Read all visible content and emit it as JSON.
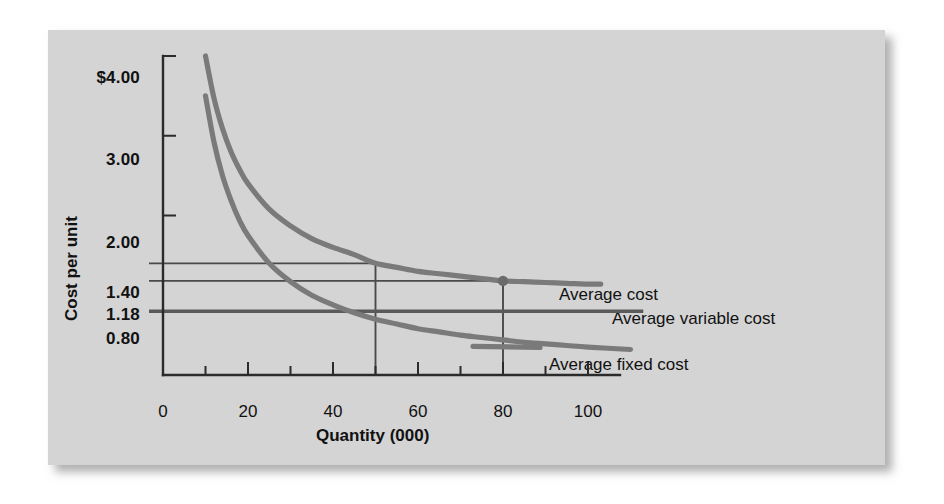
{
  "chart_data": {
    "type": "line",
    "title": "",
    "xlabel": "Quantity (000)",
    "ylabel": "Cost per unit",
    "xlim": [
      0,
      105
    ],
    "ylim": [
      0,
      4.4
    ],
    "grid": false,
    "legend_position": "right-inline",
    "x_ticks": [
      0,
      10,
      20,
      30,
      40,
      50,
      60,
      70,
      80,
      90,
      100
    ],
    "x_tick_labels": [
      "0",
      "",
      "20",
      "",
      "40",
      "",
      "60",
      "",
      "80",
      "",
      "100"
    ],
    "y_ticks": [
      0.8,
      1.18,
      1.4,
      2.0,
      3.0,
      4.0
    ],
    "y_tick_labels": [
      "0.80",
      "1.18",
      "1.40",
      "2.00",
      "3.00",
      "$4.00"
    ],
    "series": [
      {
        "name": "Average cost",
        "kind": "curve",
        "x": [
          10,
          12,
          14,
          16,
          18,
          20,
          25,
          30,
          35,
          40,
          45,
          50,
          55,
          60,
          65,
          70,
          75,
          80,
          85,
          90,
          95,
          100,
          103
        ],
        "y": [
          4.0,
          3.47,
          3.09,
          2.8,
          2.58,
          2.4,
          2.08,
          1.87,
          1.71,
          1.6,
          1.51,
          1.4,
          1.35,
          1.3,
          1.27,
          1.24,
          1.21,
          1.18,
          1.17,
          1.16,
          1.15,
          1.14,
          1.14
        ]
      },
      {
        "name": "Average fixed cost",
        "kind": "curve",
        "x": [
          10,
          12,
          14,
          16,
          18,
          20,
          25,
          30,
          35,
          40,
          45,
          50,
          55,
          60,
          65,
          70,
          75,
          80,
          85,
          90,
          95,
          100,
          110
        ],
        "y": [
          3.5,
          2.92,
          2.5,
          2.19,
          1.94,
          1.75,
          1.4,
          1.17,
          1.0,
          0.88,
          0.78,
          0.7,
          0.64,
          0.58,
          0.54,
          0.5,
          0.47,
          0.44,
          0.41,
          0.39,
          0.37,
          0.35,
          0.32
        ]
      },
      {
        "name": "Average variable cost",
        "kind": "horizontal-line",
        "y_value": 0.8,
        "x_start": 0,
        "x_end": 105
      }
    ],
    "annotations": [
      {
        "label": "",
        "type": "guide-h",
        "y_value": 1.4,
        "x_start": 0,
        "x_end": 50
      },
      {
        "label": "",
        "type": "guide-h",
        "y_value": 1.18,
        "x_start": 0,
        "x_end": 83
      },
      {
        "label": "",
        "type": "guide-v",
        "x_value": 50,
        "y_start": 0,
        "y_end": 1.4
      },
      {
        "label": "",
        "type": "guide-v",
        "x_value": 80,
        "y_start": 0,
        "y_end": 1.18
      },
      {
        "label": "",
        "type": "point",
        "x_value": 80,
        "y_value": 1.18
      }
    ],
    "series_labels": [
      {
        "text": "Average cost",
        "anchor_x": 88,
        "anchor_y": 1.18
      },
      {
        "text": "Average variable cost",
        "anchor_x": 105,
        "anchor_y": 0.8
      },
      {
        "text": "Average fixed cost",
        "anchor_x": 86,
        "anchor_y": 0.32
      }
    ],
    "colors": {
      "panel_background": "#d4d4d4",
      "curve": "#7a7a7a",
      "axis": "#2b2b2b",
      "text": "#111111",
      "guide": "#4a4a4a"
    }
  }
}
